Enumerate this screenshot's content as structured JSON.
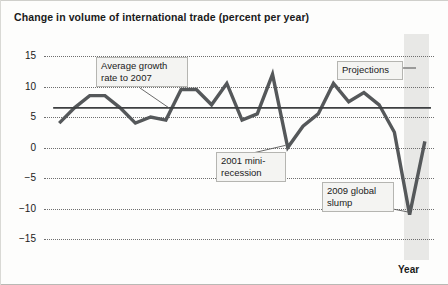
{
  "title": "Change in volume of international trade (percent per year)",
  "axis": {
    "x_title": "Year",
    "y_ticks": [
      "15",
      "10",
      "5",
      "0",
      "−5",
      "−10",
      "−15"
    ],
    "x_ticks": [
      "1985",
      "1990",
      "1995",
      "2000",
      "2005",
      "2010"
    ]
  },
  "annotations": {
    "average_growth": "Average growth\nrate to 2007",
    "recession_2001": "2001 mini-\nrecession",
    "slump_2009": "2009 global\nslump",
    "projections": "Projections"
  },
  "colors": {
    "line": "#55585a",
    "average_line": "#3d3f41",
    "grid": "#6e6e6e",
    "projection_band": "#e8e8e6",
    "text": "#1a1a1a"
  },
  "chart_data": {
    "type": "line",
    "title": "Change in volume of international trade (percent per year)",
    "xlabel": "Year",
    "ylabel": "",
    "xlim": [
      1985,
      2010.6
    ],
    "ylim": [
      -15,
      15
    ],
    "grid": true,
    "legend": "none",
    "x": [
      1986,
      1987,
      1988,
      1989,
      1990,
      1991,
      1992,
      1993,
      1994,
      1995,
      1996,
      1997,
      1998,
      1999,
      2000,
      2001,
      2002,
      2003,
      2004,
      2005,
      2006,
      2007,
      2008,
      2009,
      2010
    ],
    "series": [
      {
        "name": "Change in volume of international trade",
        "values": [
          4.0,
          6.5,
          8.5,
          8.5,
          6.5,
          4.0,
          5.0,
          4.5,
          9.5,
          9.5,
          7.0,
          10.5,
          4.5,
          5.5,
          12.0,
          0.0,
          3.5,
          5.5,
          10.5,
          7.5,
          9.0,
          7.0,
          2.5,
          -11.0,
          1.0
        ]
      }
    ],
    "reference_line": {
      "label": "Average growth rate to 2007",
      "value": 6.5,
      "x_start": 1985.6,
      "x_end": 2010.4
    },
    "shaded_region": {
      "label": "Projections",
      "x_start": 2008.6,
      "x_end": 2010.3
    },
    "annotations": [
      {
        "label": "Average growth rate to 2007",
        "points_to_x": 1993.2,
        "points_to_y": 6.5
      },
      {
        "label": "2001 mini-recession",
        "points_to_x": 2001.0,
        "points_to_y": 0.0
      },
      {
        "label": "2009 global slump",
        "points_to_x": 2009.0,
        "points_to_y": -11.0
      },
      {
        "label": "Projections",
        "points_to_x": 2009.6,
        "points_to_y": 13.0
      }
    ]
  }
}
